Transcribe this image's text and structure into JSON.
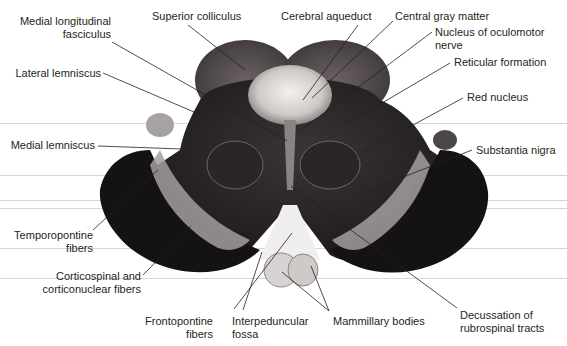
{
  "diagram": {
    "colors": {
      "background": "#ffffff",
      "label_text": "#231f20",
      "leader_line": "#231f20",
      "scan_line": "#d6d6d6",
      "tissue_dark": "#1a1718",
      "tissue_mid": "#4a4446",
      "tissue_light": "#b9b3b3",
      "aqueduct_pale": "#e6e2de"
    },
    "labels": {
      "medial_longitudinal_fasciculus": "Medial longitudinal\nfasciculus",
      "mlf_line1": "Medial longitudinal",
      "mlf_line2": "fasciculus",
      "superior_colliculus": "Superior colliculus",
      "cerebral_aqueduct": "Cerebral aqueduct",
      "central_gray_matter": "Central gray matter",
      "nucleus_oculomotor_line1": "Nucleus of oculomotor",
      "nucleus_oculomotor_line2": "nerve",
      "lateral_lemniscus": "Lateral lemniscus",
      "reticular_formation": "Reticular formation",
      "red_nucleus": "Red nucleus",
      "medial_lemniscus": "Medial lemniscus",
      "substantia_nigra": "Substantia nigra",
      "temporopontine_line1": "Temporopontine",
      "temporopontine_line2": "fibers",
      "corticospinal_line1": "Corticospinal and",
      "corticospinal_line2": "corticonuclear fibers",
      "frontopontine_line1": "Frontopontine",
      "frontopontine_line2": "fibers",
      "interpeduncular_line1": "Interpeduncular",
      "interpeduncular_line2": "fossa",
      "mammillary_bodies": "Mammillary bodies",
      "decussation_line1": "Decussation of",
      "decussation_line2": "rubrospinal tracts"
    }
  }
}
